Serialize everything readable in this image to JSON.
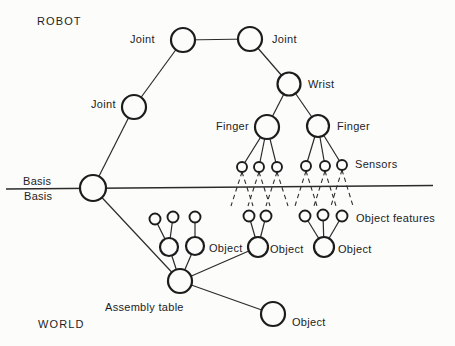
{
  "figure": {
    "labels": {
      "region_top": "ROBOT",
      "region_bottom": "WORLD",
      "joint_top_left": "Joint",
      "joint_top_right": "Joint",
      "joint_middle": "Joint",
      "wrist": "Wrist",
      "finger_left": "Finger",
      "finger_right": "Finger",
      "sensors": "Sensors",
      "basis_above_line": "Basis",
      "basis_below_line": "Basis",
      "object_features": "Object features",
      "object_left": "Object",
      "object_center": "Object",
      "object_right": "Object",
      "object_bottom": "Object",
      "assembly_table": "Assembly table"
    },
    "graph": {
      "nodes": [
        {
          "id": "joint-top-left",
          "label": "Joint",
          "region": "ROBOT"
        },
        {
          "id": "joint-top-right",
          "label": "Joint",
          "region": "ROBOT"
        },
        {
          "id": "joint-middle",
          "label": "Joint",
          "region": "ROBOT"
        },
        {
          "id": "wrist",
          "label": "Wrist",
          "region": "ROBOT"
        },
        {
          "id": "finger-left",
          "label": "Finger",
          "region": "ROBOT"
        },
        {
          "id": "finger-right",
          "label": "Finger",
          "region": "ROBOT"
        },
        {
          "id": "sensor-1",
          "label": "Sensors",
          "region": "ROBOT"
        },
        {
          "id": "sensor-2",
          "label": "Sensors",
          "region": "ROBOT"
        },
        {
          "id": "sensor-3",
          "label": "Sensors",
          "region": "ROBOT"
        },
        {
          "id": "sensor-4",
          "label": "Sensors",
          "region": "ROBOT"
        },
        {
          "id": "sensor-5",
          "label": "Sensors",
          "region": "ROBOT"
        },
        {
          "id": "sensor-6",
          "label": "Sensors",
          "region": "ROBOT"
        },
        {
          "id": "basis",
          "label": "Basis",
          "region": "boundary"
        },
        {
          "id": "object-a1",
          "label": "",
          "region": "WORLD"
        },
        {
          "id": "object-a2",
          "label": "Object",
          "region": "WORLD"
        },
        {
          "id": "object-b",
          "label": "Object",
          "region": "WORLD"
        },
        {
          "id": "object-c",
          "label": "Object",
          "region": "WORLD"
        },
        {
          "id": "object-d",
          "label": "Object",
          "region": "WORLD"
        },
        {
          "id": "assembly-table",
          "label": "Assembly table",
          "region": "WORLD"
        },
        {
          "id": "feature-a1",
          "label": "Object features",
          "region": "WORLD"
        },
        {
          "id": "feature-a2",
          "label": "Object features",
          "region": "WORLD"
        },
        {
          "id": "feature-a3",
          "label": "Object features",
          "region": "WORLD"
        },
        {
          "id": "feature-b1",
          "label": "Object features",
          "region": "WORLD"
        },
        {
          "id": "feature-b2",
          "label": "Object features",
          "region": "WORLD"
        },
        {
          "id": "feature-c1",
          "label": "Object features",
          "region": "WORLD"
        },
        {
          "id": "feature-c2",
          "label": "Object features",
          "region": "WORLD"
        },
        {
          "id": "feature-c3",
          "label": "Object features",
          "region": "WORLD"
        }
      ],
      "solid_edges": [
        [
          "joint-top-left",
          "joint-top-right"
        ],
        [
          "joint-top-left",
          "joint-middle"
        ],
        [
          "joint-middle",
          "basis"
        ],
        [
          "joint-top-right",
          "wrist"
        ],
        [
          "wrist",
          "finger-left"
        ],
        [
          "wrist",
          "finger-right"
        ],
        [
          "finger-left",
          "sensor-1"
        ],
        [
          "finger-left",
          "sensor-2"
        ],
        [
          "finger-left",
          "sensor-3"
        ],
        [
          "finger-right",
          "sensor-4"
        ],
        [
          "finger-right",
          "sensor-5"
        ],
        [
          "finger-right",
          "sensor-6"
        ],
        [
          "basis",
          "assembly-table"
        ],
        [
          "assembly-table",
          "object-a1"
        ],
        [
          "assembly-table",
          "object-a2"
        ],
        [
          "assembly-table",
          "object-b"
        ],
        [
          "assembly-table",
          "object-d"
        ],
        [
          "object-a1",
          "feature-a1"
        ],
        [
          "object-a1",
          "feature-a2"
        ],
        [
          "object-a2",
          "feature-a3"
        ],
        [
          "object-b",
          "feature-b1"
        ],
        [
          "object-b",
          "feature-b2"
        ],
        [
          "object-c",
          "feature-c1"
        ],
        [
          "object-c",
          "feature-c2"
        ],
        [
          "object-c",
          "feature-c3"
        ]
      ],
      "dashed_links": "each sensor fans two dashed lines downward across the Basis line toward the object features",
      "divider": "horizontal Basis line separating ROBOT (top) from WORLD (bottom)"
    }
  }
}
